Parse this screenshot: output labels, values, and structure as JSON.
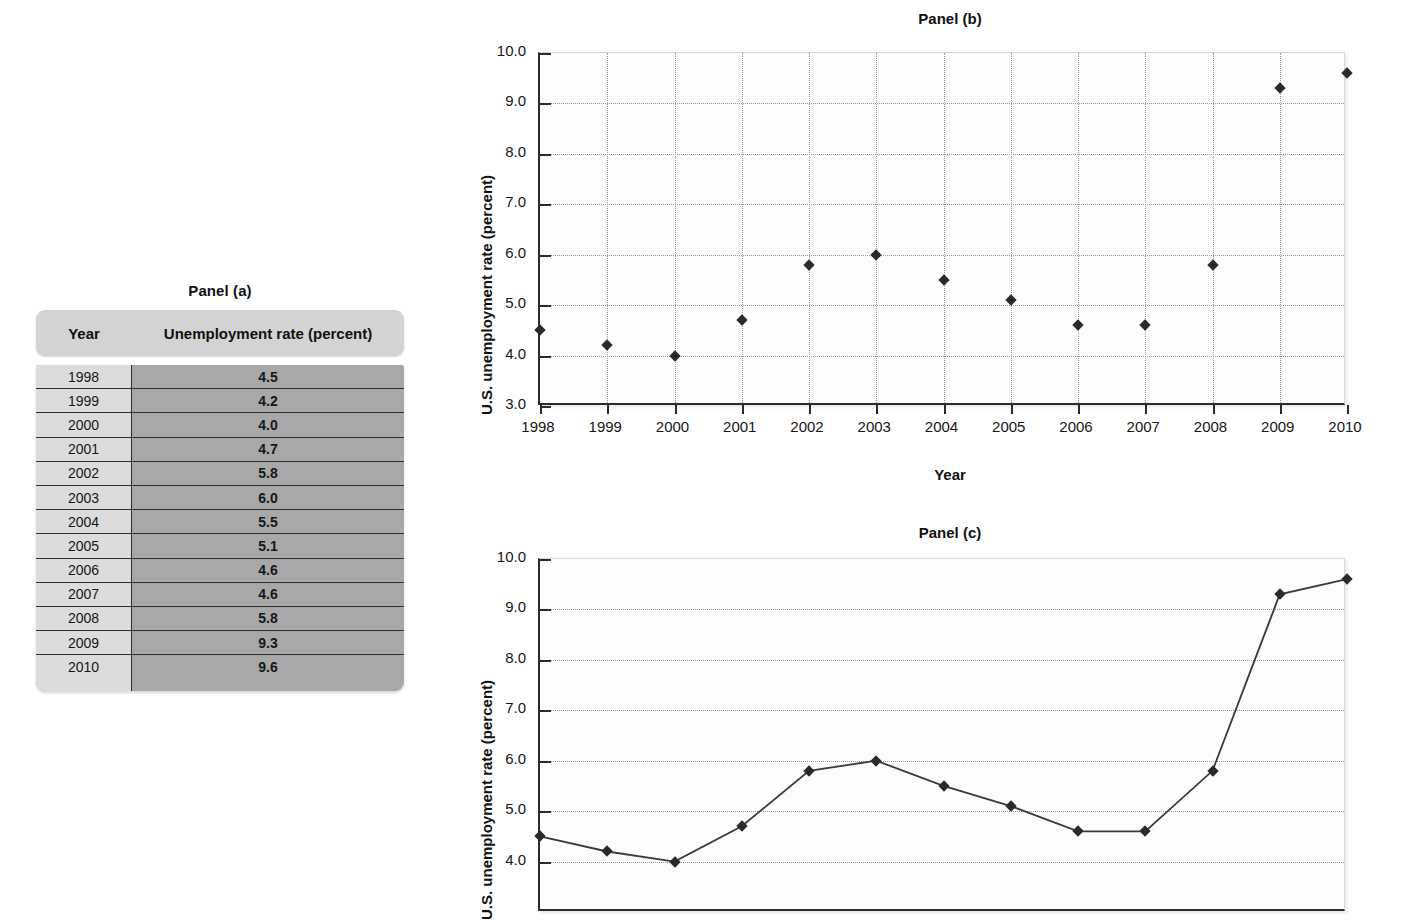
{
  "panel_a": {
    "title": "Panel (a)",
    "columns": [
      "Year",
      "Unemployment rate (percent)"
    ],
    "rows": [
      {
        "year": "1998",
        "rate": "4.5"
      },
      {
        "year": "1999",
        "rate": "4.2"
      },
      {
        "year": "2000",
        "rate": "4.0"
      },
      {
        "year": "2001",
        "rate": "4.7"
      },
      {
        "year": "2002",
        "rate": "5.8"
      },
      {
        "year": "2003",
        "rate": "6.0"
      },
      {
        "year": "2004",
        "rate": "5.5"
      },
      {
        "year": "2005",
        "rate": "5.1"
      },
      {
        "year": "2006",
        "rate": "4.6"
      },
      {
        "year": "2007",
        "rate": "4.6"
      },
      {
        "year": "2008",
        "rate": "5.8"
      },
      {
        "year": "2009",
        "rate": "9.3"
      },
      {
        "year": "2010",
        "rate": "9.6"
      }
    ]
  },
  "panel_b": {
    "title": "Panel (b)",
    "ylabel": "U.S. unemployment rate (percent)",
    "xlabel": "Year"
  },
  "panel_c": {
    "title": "Panel (c)",
    "ylabel": "U.S. unemployment rate (percent)"
  },
  "chart_data": [
    {
      "id": "panel_b",
      "type": "scatter",
      "title": "Panel (b)",
      "xlabel": "Year",
      "ylabel": "U.S. unemployment rate (percent)",
      "x": [
        1998,
        1999,
        2000,
        2001,
        2002,
        2003,
        2004,
        2005,
        2006,
        2007,
        2008,
        2009,
        2010
      ],
      "values": [
        4.5,
        4.2,
        4.0,
        4.7,
        5.8,
        6.0,
        5.5,
        5.1,
        4.6,
        4.6,
        5.8,
        9.3,
        9.6
      ],
      "categories": [
        "1998",
        "1999",
        "2000",
        "2001",
        "2002",
        "2003",
        "2004",
        "2005",
        "2006",
        "2007",
        "2008",
        "2009",
        "2010"
      ],
      "xtick_labels": [
        "1998",
        "1999",
        "2000",
        "2001",
        "2002",
        "2003",
        "2004",
        "2005",
        "2006",
        "2007",
        "2008",
        "2009",
        "2010"
      ],
      "ytick_labels": [
        "10.0",
        "9.0",
        "8.0",
        "7.0",
        "6.0",
        "5.0",
        "4.0",
        "3.0"
      ],
      "ylim": [
        3.0,
        10.0
      ],
      "xlim": [
        1998,
        2010
      ],
      "grid": "both",
      "legend": "none",
      "marker": "diamond",
      "marker_color": "#2a2a2a"
    },
    {
      "id": "panel_c",
      "type": "line",
      "title": "Panel (c)",
      "xlabel": "Year",
      "ylabel": "U.S. unemployment rate (percent)",
      "x": [
        1998,
        1999,
        2000,
        2001,
        2002,
        2003,
        2004,
        2005,
        2006,
        2007,
        2008,
        2009,
        2010
      ],
      "values": [
        4.5,
        4.2,
        4.0,
        4.7,
        5.8,
        6.0,
        5.5,
        5.1,
        4.6,
        4.6,
        5.8,
        9.3,
        9.6
      ],
      "categories": [
        "1998",
        "1999",
        "2000",
        "2001",
        "2002",
        "2003",
        "2004",
        "2005",
        "2006",
        "2007",
        "2008",
        "2009",
        "2010"
      ],
      "ytick_labels": [
        "10.0",
        "9.0",
        "8.0",
        "7.0",
        "6.0",
        "5.0",
        "4.0"
      ],
      "ylim": [
        3.0,
        10.0
      ],
      "xlim": [
        1998,
        2010
      ],
      "grid": "horizontal",
      "legend": "none",
      "marker": "diamond",
      "marker_color": "#2a2a2a",
      "line_color": "#3a3a3a",
      "note": "chart is cropped at the bottom edge of the screenshot"
    }
  ]
}
